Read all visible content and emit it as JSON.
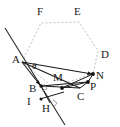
{
  "figure": {
    "width": 120,
    "height": 127,
    "background": "#ffffff",
    "colors": {
      "solid_stroke": "#1a1a1a",
      "hexagon_stroke": "#b9b9b9",
      "point_fill": "#111111",
      "label_text": "#1a1a1a",
      "right_angle_stroke": "#8a8a8a"
    },
    "points": [
      {
        "name": "A",
        "x": 22,
        "y": 62,
        "label": "A",
        "label_x": 12,
        "label_y": 55,
        "dot": false
      },
      {
        "name": "F",
        "x": 41,
        "y": 23,
        "label": "F",
        "label_x": 37,
        "label_y": 7,
        "dot": false
      },
      {
        "name": "E",
        "x": 79,
        "y": 22,
        "label": "E",
        "label_x": 74,
        "label_y": 7,
        "dot": false
      },
      {
        "name": "D",
        "x": 98,
        "y": 51,
        "label": "D",
        "label_x": 101,
        "label_y": 50,
        "dot": false
      },
      {
        "name": "N",
        "x": 93,
        "y": 74,
        "label": "N",
        "label_x": 97,
        "label_y": 70,
        "dot": true
      },
      {
        "name": "P",
        "x": 88,
        "y": 82,
        "label": "P",
        "label_x": 91,
        "label_y": 82,
        "dot": true
      },
      {
        "name": "C",
        "x": 80,
        "y": 88,
        "label": "C",
        "label_x": 78,
        "label_y": 92,
        "dot": false
      },
      {
        "name": "M",
        "x": 62,
        "y": 88,
        "label": "M",
        "label_x": 53,
        "label_y": 73,
        "dot": true
      },
      {
        "name": "B",
        "x": 41,
        "y": 86,
        "label": "B",
        "label_x": 29,
        "label_y": 84,
        "dot": true
      },
      {
        "name": "I",
        "x": 41,
        "y": 99,
        "label": "I",
        "label_x": 27,
        "label_y": 98,
        "dot": true
      },
      {
        "name": "H",
        "x": 50,
        "y": 103,
        "label": "H",
        "label_x": 42,
        "label_y": 104,
        "dot": false
      },
      {
        "name": "theta",
        "x": 36,
        "y": 68,
        "label": "θ",
        "label_x": 32,
        "label_y": 62,
        "dot": false
      }
    ],
    "hexagon": {
      "stroke": "#b9b9b9",
      "dashed": true,
      "vertices": "22,62 41,23 79,22 98,51 93,74 53,87"
    },
    "segments": [
      {
        "name": "A-N",
        "from": "22,62",
        "to": "93,74",
        "arrow": true
      },
      {
        "name": "A-B",
        "from": "22,62",
        "to": "41,86",
        "arrow": true
      },
      {
        "name": "A-C",
        "from": "22,62",
        "to": "80,88",
        "arrow": false
      },
      {
        "name": "B-P",
        "from": "41,86",
        "to": "88,82",
        "arrow": false
      },
      {
        "name": "B-C",
        "from": "41,86",
        "to": "80,88",
        "arrow": false
      },
      {
        "name": "M-N",
        "from": "62,88",
        "to": "93,74",
        "arrow": false
      },
      {
        "name": "M-P",
        "from": "62,88",
        "to": "88,82",
        "arrow": false
      },
      {
        "name": "C-P",
        "from": "80,88",
        "to": "88,82",
        "arrow": false
      },
      {
        "name": "B-H",
        "from": "41,86",
        "to": "50,103",
        "arrow": false
      },
      {
        "name": "I-H-ray",
        "from": "41,99",
        "to": "62,93",
        "arrow": false
      },
      {
        "name": "cross-line",
        "from": "5,28",
        "to": "65,125",
        "arrow": false
      }
    ],
    "right_angle_marks": [
      {
        "name": "right-angle-at-B",
        "x": 41,
        "y": 86,
        "rotation": -20
      },
      {
        "name": "right-angle-at-H",
        "x": 50,
        "y": 103,
        "rotation": 25
      }
    ]
  }
}
